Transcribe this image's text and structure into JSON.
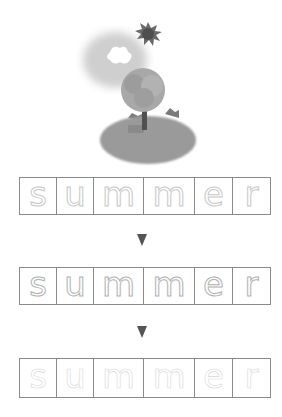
{
  "illustration": {
    "description": "summer scene with sun, cloud, tree on hill",
    "elements": [
      "sun-icon",
      "cloud-icon",
      "tree-icon",
      "hill"
    ]
  },
  "word": "summer",
  "rows": [
    {
      "style": "outline",
      "letters": [
        "s",
        "u",
        "m",
        "m",
        "e",
        "r"
      ]
    },
    {
      "style": "dotted",
      "letters": [
        "s",
        "u",
        "m",
        "m",
        "e",
        "r"
      ]
    },
    {
      "style": "faint",
      "letters": [
        "s",
        "u",
        "m",
        "m",
        "e",
        "r"
      ]
    }
  ],
  "cell_widths": [
    37,
    37,
    50,
    51,
    38,
    38
  ],
  "arrows": [
    "down-arrow-icon",
    "down-arrow-icon"
  ],
  "colors": {
    "border": "#8a8a8a",
    "arrow": "#555555",
    "letter_outline": "#c8c8c8"
  }
}
